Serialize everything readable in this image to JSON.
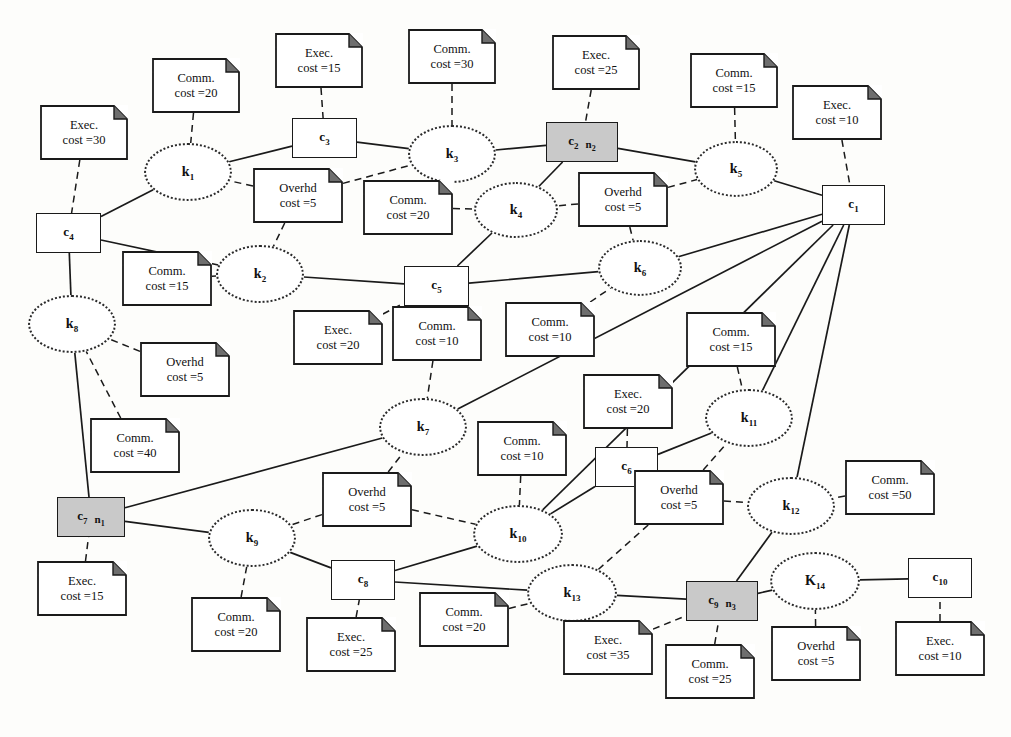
{
  "diagram": {
    "canvas": {
      "width": 1011,
      "height": 737
    },
    "colors": {
      "shaded_node_fill": "#c9c9c9",
      "stroke": "#1a1a1a",
      "background": "#fdfdfb"
    },
    "legend": {
      "component_shape": "rectangle",
      "kernel_shape": "dotted-ellipse",
      "note_shape": "folded-corner-note",
      "solid_edge": "allocation/communication link",
      "dashed_edge": "note attachment"
    }
  },
  "components": [
    {
      "id": "c1",
      "label": "c",
      "sub": "1",
      "node_ref": "",
      "node_ref_sub": "",
      "shaded": false,
      "x": 822,
      "y": 185,
      "w": 63,
      "h": 40
    },
    {
      "id": "c2",
      "label": "c",
      "sub": "2",
      "node_ref": "n",
      "node_ref_sub": "2",
      "shaded": true,
      "x": 546,
      "y": 122,
      "w": 72,
      "h": 40
    },
    {
      "id": "c3",
      "label": "c",
      "sub": "3",
      "node_ref": "",
      "node_ref_sub": "",
      "shaded": false,
      "x": 292,
      "y": 118,
      "w": 65,
      "h": 40
    },
    {
      "id": "c4",
      "label": "c",
      "sub": "4",
      "node_ref": "",
      "node_ref_sub": "",
      "shaded": false,
      "x": 36,
      "y": 213,
      "w": 65,
      "h": 40
    },
    {
      "id": "c5",
      "label": "c",
      "sub": "5",
      "node_ref": "",
      "node_ref_sub": "",
      "shaded": false,
      "x": 404,
      "y": 266,
      "w": 65,
      "h": 40
    },
    {
      "id": "c6",
      "label": "c",
      "sub": "6",
      "node_ref": "",
      "node_ref_sub": "",
      "shaded": false,
      "x": 595,
      "y": 447,
      "w": 63,
      "h": 40
    },
    {
      "id": "c7",
      "label": "c",
      "sub": "7",
      "node_ref": "n",
      "node_ref_sub": "1",
      "shaded": true,
      "x": 57,
      "y": 497,
      "w": 68,
      "h": 40
    },
    {
      "id": "c8",
      "label": "c",
      "sub": "8",
      "node_ref": "",
      "node_ref_sub": "",
      "shaded": false,
      "x": 331,
      "y": 560,
      "w": 64,
      "h": 40
    },
    {
      "id": "c9",
      "label": "c",
      "sub": "9",
      "node_ref": "n",
      "node_ref_sub": "3",
      "shaded": true,
      "x": 686,
      "y": 581,
      "w": 72,
      "h": 40
    },
    {
      "id": "c10",
      "label": "c",
      "sub": "10",
      "node_ref": "",
      "node_ref_sub": "",
      "shaded": false,
      "x": 908,
      "y": 558,
      "w": 64,
      "h": 40
    }
  ],
  "kernels": [
    {
      "id": "k1",
      "label": "k",
      "sub": "1",
      "x": 144,
      "y": 143,
      "w": 88,
      "h": 58
    },
    {
      "id": "k2",
      "label": "k",
      "sub": "2",
      "x": 216,
      "y": 245,
      "w": 88,
      "h": 58
    },
    {
      "id": "k3",
      "label": "k",
      "sub": "3",
      "x": 408,
      "y": 125,
      "w": 88,
      "h": 58
    },
    {
      "id": "k4",
      "label": "k",
      "sub": "4",
      "x": 474,
      "y": 182,
      "w": 84,
      "h": 56
    },
    {
      "id": "k5",
      "label": "k",
      "sub": "5",
      "x": 694,
      "y": 141,
      "w": 84,
      "h": 56
    },
    {
      "id": "k6",
      "label": "k",
      "sub": "6",
      "x": 598,
      "y": 240,
      "w": 84,
      "h": 56
    },
    {
      "id": "k7",
      "label": "k",
      "sub": "7",
      "x": 379,
      "y": 398,
      "w": 88,
      "h": 58
    },
    {
      "id": "k8",
      "label": "k",
      "sub": "8",
      "x": 28,
      "y": 295,
      "w": 88,
      "h": 58
    },
    {
      "id": "k9",
      "label": "k",
      "sub": "9",
      "x": 208,
      "y": 509,
      "w": 88,
      "h": 58
    },
    {
      "id": "k10",
      "label": "k",
      "sub": "10",
      "x": 473,
      "y": 505,
      "w": 90,
      "h": 58
    },
    {
      "id": "k11",
      "label": "k",
      "sub": "11",
      "x": 705,
      "y": 389,
      "w": 88,
      "h": 58
    },
    {
      "id": "k12",
      "label": "k",
      "sub": "12",
      "x": 747,
      "y": 477,
      "w": 88,
      "h": 58
    },
    {
      "id": "k13",
      "label": "k",
      "sub": "13",
      "x": 527,
      "y": 564,
      "w": 90,
      "h": 58
    },
    {
      "id": "k14",
      "label": "K",
      "sub": "14",
      "x": 770,
      "y": 552,
      "w": 90,
      "h": 58
    }
  ],
  "notes": [
    {
      "id": "n_c4_exec",
      "kind": "Exec.",
      "line1": "Exec.",
      "line2": "cost =30",
      "cost": 30,
      "attached_to": "c4",
      "x": 40,
      "y": 105,
      "w": 88,
      "h": 55
    },
    {
      "id": "n_k1_comm",
      "kind": "Comm.",
      "line1": "Comm.",
      "line2": "cost =20",
      "cost": 20,
      "attached_to": "k1",
      "x": 152,
      "y": 58,
      "w": 88,
      "h": 55
    },
    {
      "id": "n_c3_exec",
      "kind": "Exec.",
      "line1": "Exec.",
      "line2": "cost =15",
      "cost": 15,
      "attached_to": "c3",
      "x": 275,
      "y": 33,
      "w": 88,
      "h": 55
    },
    {
      "id": "n_k3_comm",
      "kind": "Comm.",
      "line1": "Comm.",
      "line2": "cost =30",
      "cost": 30,
      "attached_to": "k3",
      "x": 408,
      "y": 29,
      "w": 88,
      "h": 55
    },
    {
      "id": "n_c2_exec",
      "kind": "Exec.",
      "line1": "Exec.",
      "line2": "cost =25",
      "cost": 25,
      "attached_to": "c2",
      "x": 552,
      "y": 35,
      "w": 88,
      "h": 55
    },
    {
      "id": "n_k5_comm",
      "kind": "Comm.",
      "line1": "Comm.",
      "line2": "cost =15",
      "cost": 15,
      "attached_to": "k5",
      "x": 690,
      "y": 53,
      "w": 88,
      "h": 55
    },
    {
      "id": "n_c1_exec",
      "kind": "Exec.",
      "line1": "Exec.",
      "line2": "cost =10",
      "cost": 10,
      "attached_to": "c1",
      "x": 792,
      "y": 85,
      "w": 90,
      "h": 55
    },
    {
      "id": "n_k1k2_ovh",
      "kind": "Overhd",
      "line1": "Overhd",
      "line2": "cost =5",
      "cost": 5,
      "attached_to": "k1,k2,k3",
      "x": 253,
      "y": 168,
      "w": 90,
      "h": 55
    },
    {
      "id": "n_k4_comm",
      "kind": "Comm.",
      "line1": "Comm.",
      "line2": "cost =20",
      "cost": 20,
      "attached_to": "k4",
      "x": 363,
      "y": 180,
      "w": 90,
      "h": 55
    },
    {
      "id": "n_k56_ovh",
      "kind": "Overhd",
      "line1": "Overhd",
      "line2": "cost =5",
      "cost": 5,
      "attached_to": "k4,k5,k6",
      "x": 578,
      "y": 172,
      "w": 90,
      "h": 55
    },
    {
      "id": "n_k8_comm",
      "kind": "Comm.",
      "line1": "Comm.",
      "line2": "cost =15",
      "cost": 15,
      "attached_to": "k2",
      "x": 122,
      "y": 251,
      "w": 90,
      "h": 55
    },
    {
      "id": "n_k8_ovh",
      "kind": "Overhd",
      "line1": "Overhd",
      "line2": "cost =5",
      "cost": 5,
      "attached_to": "k8",
      "x": 140,
      "y": 342,
      "w": 90,
      "h": 55
    },
    {
      "id": "n_c5_exec",
      "kind": "Exec.",
      "line1": "Exec.",
      "line2": "cost =20",
      "cost": 20,
      "attached_to": "c5",
      "x": 293,
      "y": 310,
      "w": 90,
      "h": 55
    },
    {
      "id": "n_k7_comm",
      "kind": "Comm.",
      "line1": "Comm.",
      "line2": "cost =10",
      "cost": 10,
      "attached_to": "k7",
      "x": 392,
      "y": 306,
      "w": 90,
      "h": 55
    },
    {
      "id": "n_k6_comm",
      "kind": "Comm.",
      "line1": "Comm.",
      "line2": "cost =10",
      "cost": 10,
      "attached_to": "k6",
      "x": 505,
      "y": 302,
      "w": 90,
      "h": 55
    },
    {
      "id": "n_k11_comm",
      "kind": "Comm.",
      "line1": "Comm.",
      "line2": "cost =15",
      "cost": 15,
      "attached_to": "k11",
      "x": 686,
      "y": 312,
      "w": 90,
      "h": 55
    },
    {
      "id": "n_c6_exec",
      "kind": "Exec.",
      "line1": "Exec.",
      "line2": "cost =20",
      "cost": 20,
      "attached_to": "c6",
      "x": 583,
      "y": 374,
      "w": 90,
      "h": 55
    },
    {
      "id": "n_k8_comm40",
      "kind": "Comm.",
      "line1": "Comm.",
      "line2": "cost =40",
      "cost": 40,
      "attached_to": "k8",
      "x": 90,
      "y": 418,
      "w": 90,
      "h": 55
    },
    {
      "id": "n_k7_ovh",
      "kind": "Overhd",
      "line1": "Overhd",
      "line2": "cost =5",
      "cost": 5,
      "attached_to": "k7,k9,k10",
      "x": 322,
      "y": 472,
      "w": 90,
      "h": 55
    },
    {
      "id": "n_k10_comm",
      "kind": "Comm.",
      "line1": "Comm.",
      "line2": "cost =10",
      "cost": 10,
      "attached_to": "k10",
      "x": 477,
      "y": 421,
      "w": 90,
      "h": 55
    },
    {
      "id": "n_k12_ovh",
      "kind": "Overhd",
      "line1": "Overhd",
      "line2": "cost =5",
      "cost": 5,
      "attached_to": "k11,k12,k13",
      "x": 634,
      "y": 470,
      "w": 90,
      "h": 55
    },
    {
      "id": "n_k12_comm",
      "kind": "Comm.",
      "line1": "Comm.",
      "line2": "cost =50",
      "cost": 50,
      "attached_to": "k12",
      "x": 845,
      "y": 460,
      "w": 90,
      "h": 55
    },
    {
      "id": "n_c7_exec",
      "kind": "Exec.",
      "line1": "Exec.",
      "line2": "cost =15",
      "cost": 15,
      "attached_to": "c7",
      "x": 37,
      "y": 561,
      "w": 90,
      "h": 55
    },
    {
      "id": "n_k9_comm",
      "kind": "Comm.",
      "line1": "Comm.",
      "line2": "cost =20",
      "cost": 20,
      "attached_to": "k9",
      "x": 191,
      "y": 597,
      "w": 90,
      "h": 55
    },
    {
      "id": "n_c8_exec",
      "kind": "Exec.",
      "line1": "Exec.",
      "line2": "cost =25",
      "cost": 25,
      "attached_to": "c8",
      "x": 306,
      "y": 617,
      "w": 90,
      "h": 55
    },
    {
      "id": "n_k13_comm",
      "kind": "Comm.",
      "line1": "Comm.",
      "line2": "cost =20",
      "cost": 20,
      "attached_to": "k13",
      "x": 419,
      "y": 592,
      "w": 90,
      "h": 55
    },
    {
      "id": "n_c9_exec",
      "kind": "Exec.",
      "line1": "Exec.",
      "line2": "cost =35",
      "cost": 35,
      "attached_to": "c9",
      "x": 563,
      "y": 620,
      "w": 90,
      "h": 55
    },
    {
      "id": "n_c9_comm",
      "kind": "Comm.",
      "line1": "Comm.",
      "line2": "cost =25",
      "cost": 25,
      "attached_to": "c9",
      "x": 665,
      "y": 644,
      "w": 90,
      "h": 55
    },
    {
      "id": "n_k14_ovh",
      "kind": "Overhd",
      "line1": "Overhd",
      "line2": "cost =5",
      "cost": 5,
      "attached_to": "k14",
      "x": 771,
      "y": 626,
      "w": 90,
      "h": 55
    },
    {
      "id": "n_c10_exec",
      "kind": "Exec.",
      "line1": "Exec.",
      "line2": "cost =10",
      "cost": 10,
      "attached_to": "c10",
      "x": 895,
      "y": 621,
      "w": 90,
      "h": 55
    }
  ],
  "solid_edges": [
    [
      "c3",
      "k1"
    ],
    [
      "c3",
      "k3"
    ],
    [
      "k1",
      "c4"
    ],
    [
      "c4",
      "k2"
    ],
    [
      "c4",
      "k8"
    ],
    [
      "k3",
      "c2"
    ],
    [
      "c2",
      "k4"
    ],
    [
      "c2",
      "k5"
    ],
    [
      "k2",
      "c5"
    ],
    [
      "c5",
      "k4"
    ],
    [
      "c5",
      "k6"
    ],
    [
      "k5",
      "c1"
    ],
    [
      "k6",
      "c1"
    ],
    [
      "c1",
      "k7"
    ],
    [
      "c1",
      "k10"
    ],
    [
      "c1",
      "k11"
    ],
    [
      "c1",
      "k12"
    ],
    [
      "k7",
      "c7"
    ],
    [
      "k8",
      "c7"
    ],
    [
      "c7",
      "k9"
    ],
    [
      "k9",
      "c8"
    ],
    [
      "c8",
      "k10"
    ],
    [
      "c8",
      "k13"
    ],
    [
      "k10",
      "c6"
    ],
    [
      "c6",
      "k11"
    ],
    [
      "k12",
      "c9"
    ],
    [
      "k13",
      "c9"
    ],
    [
      "c9",
      "k14"
    ],
    [
      "k14",
      "c10"
    ]
  ],
  "dashed_edges": [
    [
      "n_c4_exec",
      "c4"
    ],
    [
      "n_k1_comm",
      "k1"
    ],
    [
      "n_c3_exec",
      "c3"
    ],
    [
      "n_k3_comm",
      "k3"
    ],
    [
      "n_c2_exec",
      "c2"
    ],
    [
      "n_k5_comm",
      "k5"
    ],
    [
      "n_c1_exec",
      "c1"
    ],
    [
      "n_k1k2_ovh",
      "k1"
    ],
    [
      "n_k1k2_ovh",
      "k2"
    ],
    [
      "n_k1k2_ovh",
      "k3"
    ],
    [
      "n_k4_comm",
      "k4"
    ],
    [
      "n_k56_ovh",
      "k4"
    ],
    [
      "n_k56_ovh",
      "k5"
    ],
    [
      "n_k56_ovh",
      "k6"
    ],
    [
      "n_k8_comm",
      "k2"
    ],
    [
      "n_k8_ovh",
      "k8"
    ],
    [
      "n_c5_exec",
      "c5"
    ],
    [
      "n_k7_comm",
      "k7"
    ],
    [
      "n_k6_comm",
      "k6"
    ],
    [
      "n_k11_comm",
      "k11"
    ],
    [
      "n_c6_exec",
      "c6"
    ],
    [
      "n_k8_comm40",
      "k8"
    ],
    [
      "n_k7_ovh",
      "k7"
    ],
    [
      "n_k7_ovh",
      "k9"
    ],
    [
      "n_k7_ovh",
      "k10"
    ],
    [
      "n_k10_comm",
      "k10"
    ],
    [
      "n_k12_ovh",
      "k11"
    ],
    [
      "n_k12_ovh",
      "k12"
    ],
    [
      "n_k12_ovh",
      "k13"
    ],
    [
      "n_k12_comm",
      "k12"
    ],
    [
      "n_c7_exec",
      "c7"
    ],
    [
      "n_k9_comm",
      "k9"
    ],
    [
      "n_c8_exec",
      "c8"
    ],
    [
      "n_k13_comm",
      "k13"
    ],
    [
      "n_c9_exec",
      "c9"
    ],
    [
      "n_c9_comm",
      "c9"
    ],
    [
      "n_k14_ovh",
      "k14"
    ],
    [
      "n_c10_exec",
      "c10"
    ]
  ]
}
